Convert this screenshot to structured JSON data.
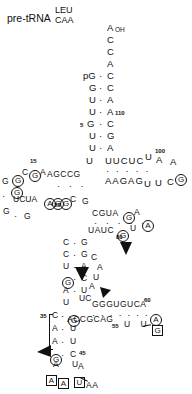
{
  "figure": {
    "domain_type": "rna-secondary-structure",
    "title_main": "pre-tRNA",
    "title_sup": "LEU",
    "title_sub": "CAA",
    "ink_color": "#111111",
    "background": "#ffffff"
  },
  "acceptor_stem": {
    "three_prime_tail": [
      "A",
      "C",
      "C",
      "A"
    ],
    "three_prime_label": "OH",
    "five_prime_label": "pG",
    "pairs": [
      {
        "left": "pG",
        "right": "C",
        "bond": "·"
      },
      {
        "left": "G",
        "right": "C",
        "bond": "·"
      },
      {
        "left": "U",
        "right": "A",
        "bond": "·"
      },
      {
        "left": "U",
        "right": "A",
        "bond": "·",
        "right_num": "110"
      },
      {
        "left": "G",
        "right": "C",
        "bond": "·",
        "left_num": "5"
      },
      {
        "left": "U",
        "right": "G",
        "bond": "·"
      },
      {
        "left": "U",
        "right": "A",
        "bond": "·"
      }
    ],
    "loop_U": "U"
  },
  "t_arm": {
    "top_strand": "UUCUC",
    "bottom_strand": "AAGAG",
    "dots": "· · · · ·",
    "loop_top_right": [
      "U",
      "A",
      "A"
    ],
    "loop_num": "100",
    "loop_circ_G": "G",
    "loop_bottom": [
      "U",
      "U",
      "C"
    ]
  },
  "d_arm": {
    "loop_left": [
      {
        "ch": "G",
        "circled": true
      },
      {
        "ch": "C",
        "circled": false
      },
      {
        "ch": "G",
        "circled": true,
        "num": "15"
      },
      {
        "ch": "A",
        "circled": false
      }
    ],
    "loop_outer_G": {
      "ch": "G",
      "circled": true
    },
    "top_strand": "AGCCG",
    "dots": "· · ·",
    "bottom_left": "UCUA",
    "bottom_strand": [
      {
        "ch": "A",
        "circled": true
      },
      {
        "ch": "G",
        "circled": true
      },
      {
        "ch": "G",
        "circled": true
      },
      {
        "ch": "C",
        "circled": false
      }
    ],
    "bottom_num": "25",
    "tail_G": "G"
  },
  "core": {
    "left_col": [
      "G",
      "·",
      "G",
      "·",
      "G"
    ],
    "mid_cgua": "CGUA",
    "mid_circ_G": "G",
    "mid_A": "A",
    "circ_A_right": "A",
    "row_uauc": "UAUC",
    "circ_G_80": "G",
    "num_80": "80",
    "tail_U": "U"
  },
  "anticodon_stem": {
    "pairs": [
      {
        "left": "C",
        "right": "G",
        "bond": "·"
      },
      {
        "left": "C",
        "right": "G",
        "bond": "·"
      },
      {
        "left": "U",
        "right": "A",
        "bond": "·"
      },
      {
        "left": "G",
        "right": "C",
        "bond": "·",
        "left_circled": true
      },
      {
        "left": "A",
        "right": "U",
        "bond": "·"
      },
      {
        "left": "U",
        "right": "C",
        "bond": "",
        "unpaired": true
      },
      {
        "left": "U",
        "right": "A",
        "bond": "·",
        "num": "",
        "prefix": "U·ACC"
      },
      {
        "left": "C",
        "right": "G",
        "bond": "·",
        "num": "35",
        "right_circled": true
      },
      {
        "left": "A",
        "right": "U",
        "bond": "·"
      },
      {
        "left": "A",
        "right": "U",
        "bond": "·"
      },
      {
        "left": "G",
        "right": "C",
        "bond": "·",
        "left_circled": true,
        "right_num": "45"
      }
    ]
  },
  "variable_loop": {
    "top": [
      "C",
      "A",
      "U",
      "A"
    ],
    "uc": "UC",
    "strand_top": "GGGUGUCA",
    "strand_bottom": "ACCGCAG",
    "num_60": "60",
    "num_55": "55",
    "circ_A": "A",
    "tail_UU": "U U",
    "box_G": "G",
    "dots": "· · · · · · ·"
  },
  "anticodon_loop": {
    "left_A": "A",
    "boxed": [
      "A",
      "A"
    ],
    "mid_U": "U",
    "right_U": "U",
    "right_A": "A",
    "bottom_AA": "AA"
  },
  "annotations": {
    "cleavage_arrows": 3,
    "arrow_glyph": "➤"
  }
}
